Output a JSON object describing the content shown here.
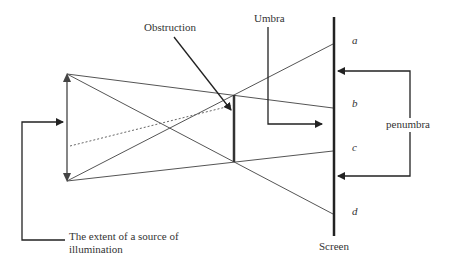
{
  "diagram": {
    "labels": {
      "obstruction": "Obstruction",
      "umbra": "Umbra",
      "penumbra": "penumbra",
      "screen": "Screen",
      "source_line1": "The extent of a source of",
      "source_line2": "illumination"
    },
    "screen_points": {
      "a": "a",
      "b": "b",
      "c": "c",
      "d": "d"
    },
    "colors": {
      "line": "#444444",
      "thick": "#222222",
      "text": "#333333"
    }
  }
}
